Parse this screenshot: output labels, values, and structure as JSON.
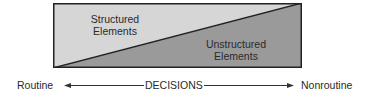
{
  "diagram": {
    "regions": [
      {
        "label_line1": "Structured",
        "label_line2": "Elements",
        "fill": "#d6d6d6"
      },
      {
        "label_line1": "Unstructured",
        "label_line2": "Elements",
        "fill": "#9a9a9a"
      }
    ],
    "border_color": "#222222",
    "axis": {
      "left_label": "Routine",
      "center_label": "DECISIONS",
      "right_label": "Nonroutine"
    }
  }
}
